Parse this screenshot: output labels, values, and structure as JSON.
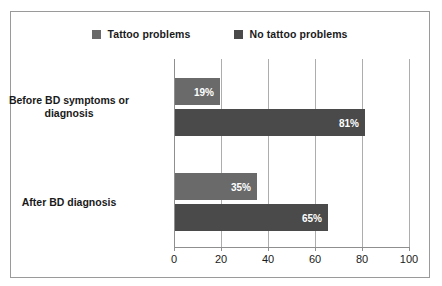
{
  "chart_data": {
    "type": "bar",
    "orientation": "horizontal",
    "title": "",
    "xlabel": "",
    "ylabel": "",
    "categories": [
      "Before BD symptoms or diagnosis",
      "After BD diagnosis"
    ],
    "series": [
      {
        "name": "Tattoo problems",
        "color": "#6a6a6a",
        "values": [
          19,
          35
        ],
        "labels": [
          "19%",
          "35%"
        ]
      },
      {
        "name": "No tattoo problems",
        "color": "#4a4a4a",
        "values": [
          81,
          65
        ],
        "labels": [
          "81%",
          "65%"
        ]
      }
    ],
    "xlim": [
      0,
      100
    ],
    "xticks": [
      0,
      20,
      40,
      60,
      80,
      100
    ],
    "xtick_labels": [
      "0",
      "20",
      "40",
      "60",
      "80",
      "100"
    ],
    "grid": true,
    "legend_position": "top-center"
  },
  "legend": {
    "items": [
      {
        "label": "Tattoo problems",
        "color": "#6a6a6a"
      },
      {
        "label": "No tattoo problems",
        "color": "#4a4a4a"
      }
    ]
  },
  "axis": {
    "tick_labels": [
      "0",
      "20",
      "40",
      "60",
      "80",
      "100"
    ]
  },
  "categories": {
    "first_line1": "Before BD symptoms or",
    "first_line2": "diagnosis",
    "second": "After BD diagnosis"
  },
  "bars": {
    "g1_light": "19%",
    "g1_dark": "81%",
    "g2_light": "35%",
    "g2_dark": "65%"
  }
}
